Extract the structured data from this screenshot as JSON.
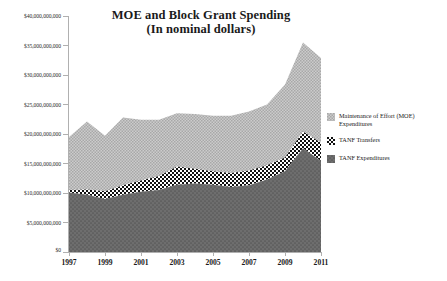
{
  "chart_data": {
    "type": "area",
    "stacked": true,
    "title": "MOE and Block Grant Spending",
    "subtitle": "(In nominal dollars)",
    "xlabel": "",
    "ylabel": "",
    "grid": false,
    "legend_position": "right",
    "x": [
      1997,
      1998,
      1999,
      2000,
      2001,
      2002,
      2003,
      2004,
      2005,
      2006,
      2007,
      2008,
      2009,
      2010,
      2011
    ],
    "xtick_labels": [
      "1997",
      "1999",
      "2001",
      "2003",
      "2005",
      "2007",
      "2009",
      "2011"
    ],
    "xlim": [
      1997,
      2011
    ],
    "ylim": [
      0,
      40000000000
    ],
    "ytick_labels": [
      "$0",
      "$5,000,000,000",
      "$10,000,000,000",
      "$15,000,000,000",
      "$20,000,000,000",
      "$25,000,000,000",
      "$30,000,000,000",
      "$35,000,000,000",
      "$40,000,000,000"
    ],
    "ytick_values": [
      0,
      5000000000,
      10000000000,
      15000000000,
      20000000000,
      25000000000,
      30000000000,
      35000000000,
      40000000000
    ],
    "series": [
      {
        "name": "TANF Expenditures",
        "pattern": "dark-gray-dotted",
        "color": "#636363",
        "values": [
          10100000000,
          9700000000,
          9000000000,
          9700000000,
          10200000000,
          10500000000,
          11400000000,
          11600000000,
          11400000000,
          11000000000,
          11300000000,
          12300000000,
          13700000000,
          17600000000,
          15400000000
        ]
      },
      {
        "name": "TANF Transfers",
        "pattern": "checkerboard",
        "color": "#000000",
        "values": [
          400000000,
          900000000,
          1300000000,
          1600000000,
          1900000000,
          2400000000,
          3100000000,
          2500000000,
          2300000000,
          2400000000,
          2500000000,
          2400000000,
          2300000000,
          2800000000,
          3100000000
        ]
      },
      {
        "name": "Maintenance of Effort (MOE) Expenditures",
        "pattern": "light-gray-stipple",
        "color": "#bdbdbd",
        "values": [
          9000000000,
          11500000000,
          9400000000,
          11500000000,
          10300000000,
          9500000000,
          9000000000,
          9300000000,
          9400000000,
          9700000000,
          10000000000,
          10300000000,
          12400000000,
          15100000000,
          14400000000
        ]
      }
    ],
    "series_totals": [
      19500000000,
      22100000000,
      19700000000,
      22800000000,
      22400000000,
      22400000000,
      23500000000,
      23400000000,
      23100000000,
      23100000000,
      23800000000,
      25000000000,
      28400000000,
      35500000000,
      32900000000
    ]
  },
  "legend": {
    "items": [
      {
        "label_line1": "Maintenance of Effort (MOE)",
        "label_line2": "Expenditures",
        "swatch": "light-gray-stipple"
      },
      {
        "label_line1": "TANF Transfers",
        "label_line2": "",
        "swatch": "checkerboard"
      },
      {
        "label_line1": "TANF Expenditures",
        "label_line2": "",
        "swatch": "dark-gray-dotted"
      }
    ]
  },
  "colors": {
    "moe": "#bdbdbd",
    "transfers": "#000000",
    "tanf": "#636363",
    "axis": "#b0b0b0",
    "text": "#1a1a1a",
    "background": "#ffffff"
  }
}
